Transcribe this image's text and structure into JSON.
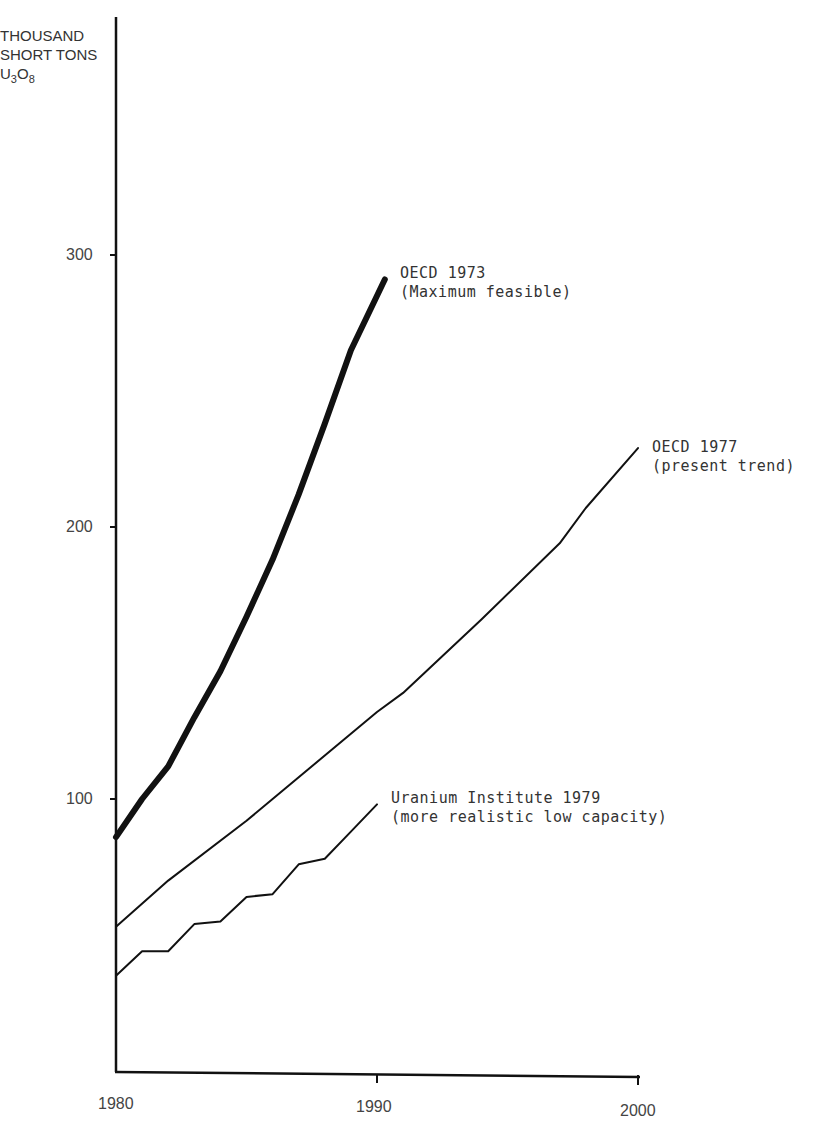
{
  "chart_data": {
    "type": "line",
    "title": "",
    "xlabel": "",
    "ylabel": "THOUSAND SHORT TONS U3O8",
    "ylabel_lines": [
      "THOUSAND",
      "SHORT TONS",
      "U",
      "3",
      "O",
      "8"
    ],
    "x_ticks": [
      "1980",
      "1990",
      "2000"
    ],
    "y_ticks": [
      "100",
      "200",
      "300"
    ],
    "xlim": [
      1980,
      2000
    ],
    "ylim": [
      0,
      390
    ],
    "grid": false,
    "legend_position": "inline labels at line ends",
    "series": [
      {
        "name": "OECD 1973 (Maximum feasible)",
        "label_line1": "OECD 1973",
        "label_line2": "(Maximum feasible)",
        "style": "thick",
        "x": [
          1980,
          1981,
          1982,
          1983,
          1984,
          1985,
          1986,
          1987,
          1988,
          1989,
          1990.3
        ],
        "values": [
          86,
          100,
          112,
          130,
          147,
          167,
          188,
          212,
          238,
          265,
          291
        ]
      },
      {
        "name": "OECD 1977 (present trend)",
        "label_line1": "OECD 1977",
        "label_line2": "(present trend)",
        "style": "thin",
        "x": [
          1980,
          1982,
          1985,
          1986,
          1990,
          1991,
          1994,
          1997,
          1998,
          2000
        ],
        "values": [
          53,
          70,
          92,
          100,
          132,
          139,
          166,
          194,
          207,
          229
        ]
      },
      {
        "name": "Uranium Institute 1979 (more realistic low capacity)",
        "label_line1": "Uranium Institute 1979",
        "label_line2": "(more realistic low capacity)",
        "style": "stepped",
        "x": [
          1980,
          1981,
          1982,
          1983,
          1984,
          1985,
          1986,
          1987,
          1988,
          1989,
          1990
        ],
        "values": [
          35,
          44,
          44,
          54,
          55,
          64,
          65,
          76,
          78,
          88,
          98
        ]
      }
    ]
  }
}
